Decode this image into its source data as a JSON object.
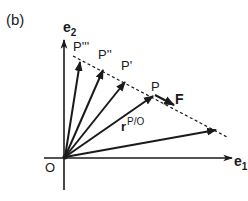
{
  "figure": {
    "panel_label": "(b)",
    "axes": {
      "e1_label": "e",
      "e1_sub": "1",
      "e2_label": "e",
      "e2_sub": "2",
      "origin_label": "O"
    },
    "points": [
      {
        "name": "P'''",
        "label": "P'''"
      },
      {
        "name": "P''",
        "label": "P''"
      },
      {
        "name": "P'",
        "label": "P'"
      },
      {
        "name": "P",
        "label": "P"
      }
    ],
    "force_label": "F",
    "position_vector": {
      "label": "r",
      "superscript": "P/O"
    },
    "colors": {
      "ink": "#1a1a1a",
      "background": "#ffffff"
    }
  }
}
